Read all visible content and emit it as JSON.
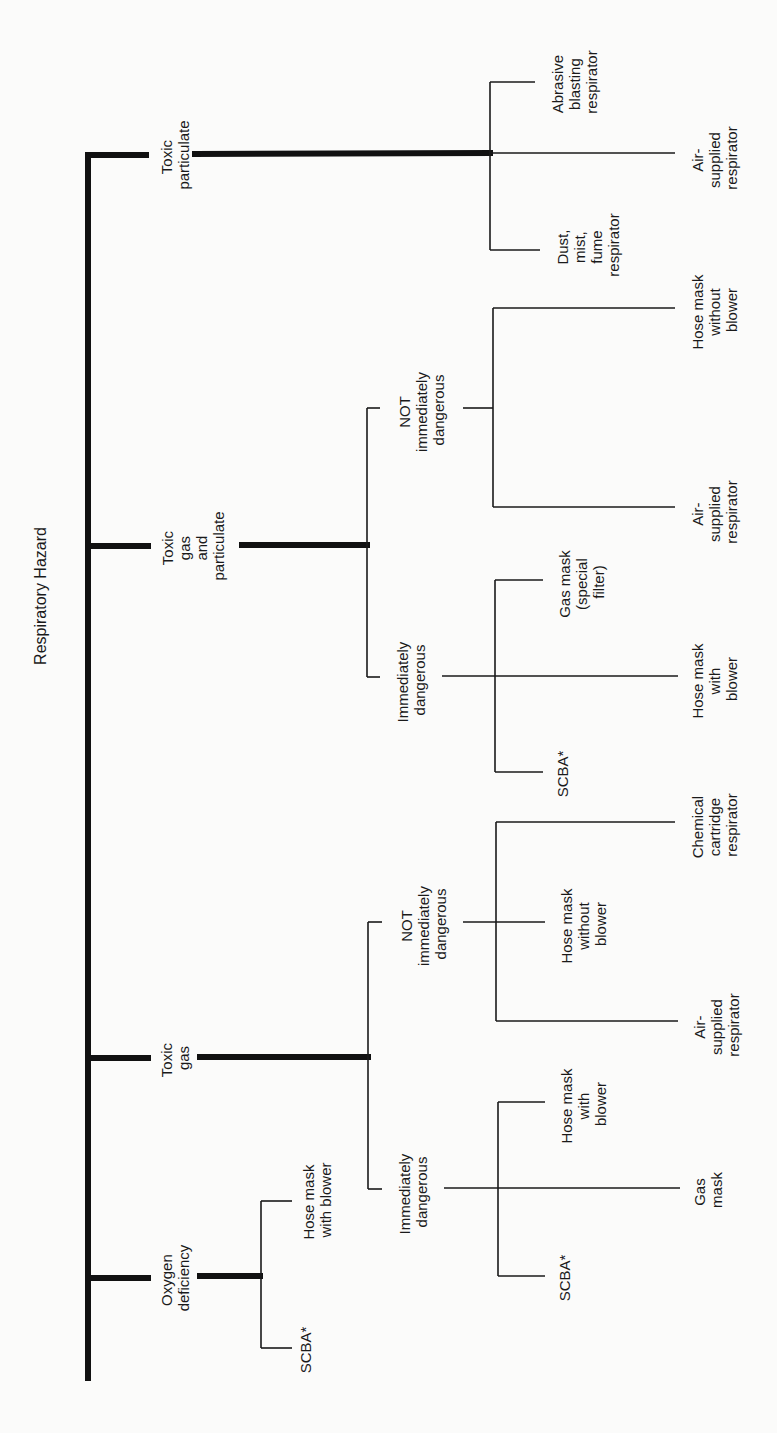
{
  "title": "Respiratory Hazard",
  "colors": {
    "background": "#fbfbfa",
    "ink": "#1a1a1a"
  },
  "hazards": [
    {
      "label": [
        "Toxic",
        "particulate"
      ],
      "solutions": [
        {
          "label": [
            "Abrasive",
            "blasting",
            "respirator"
          ]
        },
        {
          "label": [
            "Air-",
            "supplied",
            "respirator"
          ]
        },
        {
          "label": [
            "Dust,",
            "mist,",
            "fume",
            "respirator"
          ]
        }
      ]
    },
    {
      "label": [
        "Toxic",
        "gas",
        "and",
        "particulate"
      ],
      "conditions": [
        {
          "label": [
            "NOT",
            "immediately",
            "dangerous"
          ],
          "solutions": [
            {
              "label": [
                "Hose mask",
                "without",
                "blower"
              ]
            },
            {
              "label": [
                "Air-",
                "supplied",
                "respirator"
              ]
            }
          ]
        },
        {
          "label": [
            "Immediately",
            "dangerous"
          ],
          "solutions": [
            {
              "label": [
                "Gas mask",
                "(special",
                "filter)"
              ]
            },
            {
              "label": [
                "Hose mask",
                "with",
                "blower"
              ]
            },
            {
              "label": [
                "SCBA*"
              ]
            }
          ]
        }
      ]
    },
    {
      "label": [
        "Toxic",
        "gas"
      ],
      "conditions": [
        {
          "label": [
            "NOT",
            "immediately",
            "dangerous"
          ],
          "solutions": [
            {
              "label": [
                "Chemical",
                "cartridge",
                "respirator"
              ]
            },
            {
              "label": [
                "Hose mask",
                "without",
                "blower"
              ]
            },
            {
              "label": [
                "Air-",
                "supplied",
                "respirator"
              ]
            }
          ]
        },
        {
          "label": [
            "Immediately",
            "dangerous"
          ],
          "solutions": [
            {
              "label": [
                "Hose mask",
                "with",
                "blower"
              ]
            },
            {
              "label": [
                "Gas",
                "mask"
              ]
            },
            {
              "label": [
                "SCBA*"
              ]
            }
          ]
        }
      ]
    },
    {
      "label": [
        "Oxygen",
        "deficiency"
      ],
      "solutions": [
        {
          "label": [
            "Hose mask",
            "with blower"
          ]
        },
        {
          "label": [
            "SCBA*"
          ]
        }
      ]
    }
  ]
}
